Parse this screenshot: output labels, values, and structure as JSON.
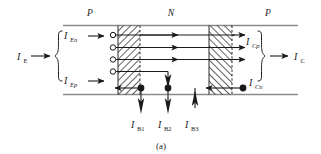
{
  "figure": {
    "caption": "(a)",
    "type": "pnp-transistor-current-components",
    "regions": [
      {
        "id": "emitter",
        "label": "P"
      },
      {
        "id": "base",
        "label": "N"
      },
      {
        "id": "collector",
        "label": "P"
      }
    ],
    "currents": {
      "emitter_total": {
        "symbol": "I",
        "sub": "E",
        "label": "I_E"
      },
      "emitter_electron": {
        "symbol": "I",
        "sub": "En",
        "label": "I_En"
      },
      "emitter_hole": {
        "symbol": "I",
        "sub": "Ep",
        "label": "I_Ep"
      },
      "collector_hole": {
        "symbol": "I",
        "sub": "Cp",
        "label": "I_Cp"
      },
      "collector_electron": {
        "symbol": "I",
        "sub": "Cn",
        "label": "I_Cn"
      },
      "collector_total": {
        "symbol": "I",
        "sub": "C",
        "label": "I_C"
      },
      "base_1": {
        "symbol": "I",
        "sub": "B1",
        "label": "I_B1"
      },
      "base_2": {
        "symbol": "I",
        "sub": "B2",
        "label": "I_B2"
      },
      "base_3": {
        "symbol": "I",
        "sub": "B3",
        "label": "I_B3"
      }
    },
    "colors": {
      "ink": "#1a1a1a",
      "rail": "#8a8a8a",
      "hatch": "#2b2b2b",
      "background": "#ffffff"
    }
  }
}
